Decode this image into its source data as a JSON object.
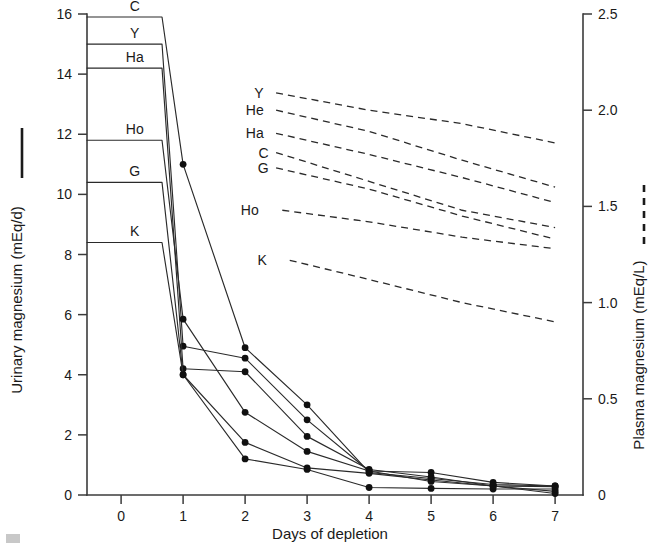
{
  "chart_data": {
    "type": "line",
    "title": "",
    "xlabel": "Days of depletion",
    "ylabel_left": "Urinary magnesium (mEq/d)",
    "ylabel_right": "Plasma magnesium (mEq/L)",
    "xlim": [
      -0.55,
      7.45
    ],
    "x_ticks": [
      0,
      1,
      2,
      3,
      4,
      5,
      6,
      7
    ],
    "x_tick_labels": [
      "0",
      "1",
      "2",
      "3",
      "4",
      "5",
      "6",
      "7"
    ],
    "ylim_left": [
      0,
      16
    ],
    "y_ticks_left": [
      0,
      2,
      4,
      6,
      8,
      10,
      12,
      14,
      16
    ],
    "y_tick_labels_left": [
      "0",
      "2",
      "4",
      "6",
      "8",
      "10",
      "12",
      "14",
      "16"
    ],
    "ylim_right": [
      0,
      2.5
    ],
    "y_ticks_right": [
      0,
      0.5,
      1.0,
      1.5,
      2.0,
      2.5
    ],
    "y_tick_labels_right": [
      "0",
      "0.5",
      "1.0",
      "1.5",
      "2.0",
      "2.5"
    ],
    "grid": false,
    "legend_position": "inline-labels",
    "urinary_series": [
      {
        "name": "C",
        "label": "C",
        "label_x": 0.22,
        "baseline_end_x": 0.66,
        "x": [
          0,
          1,
          2,
          3,
          4,
          5,
          6,
          7
        ],
        "y": [
          15.9,
          11.0,
          4.9,
          3.0,
          0.75,
          0.55,
          0.35,
          0.3
        ]
      },
      {
        "name": "Y",
        "label": "Y",
        "label_x": 0.22,
        "baseline_end_x": 0.66,
        "x": [
          0,
          1,
          2,
          3,
          4,
          5,
          6,
          7
        ],
        "y": [
          15.0,
          4.95,
          4.55,
          2.5,
          0.8,
          0.45,
          0.3,
          0.28
        ]
      },
      {
        "name": "Ha",
        "label": "Ha",
        "label_x": 0.22,
        "baseline_end_x": 0.66,
        "x": [
          0,
          1,
          2,
          3,
          4,
          5,
          6,
          7
        ],
        "y": [
          14.2,
          4.2,
          4.1,
          1.95,
          0.85,
          0.6,
          0.3,
          0.12
        ]
      },
      {
        "name": "Ho",
        "label": "Ho",
        "label_x": 0.22,
        "baseline_end_x": 0.66,
        "x": [
          0,
          1,
          2,
          3,
          4,
          5,
          6,
          7
        ],
        "y": [
          11.8,
          5.85,
          2.75,
          1.45,
          0.8,
          0.75,
          0.42,
          0.3
        ]
      },
      {
        "name": "G",
        "label": "G",
        "label_x": 0.22,
        "baseline_end_x": 0.66,
        "x": [
          0,
          1,
          2,
          3,
          4,
          5,
          6,
          7
        ],
        "y": [
          10.4,
          4.0,
          1.75,
          0.9,
          0.72,
          0.5,
          0.3,
          0.05
        ]
      },
      {
        "name": "K",
        "label": "K",
        "label_x": 0.22,
        "baseline_end_x": 0.66,
        "x": [
          0,
          1,
          2,
          3,
          4,
          5,
          6,
          7
        ],
        "y": [
          8.4,
          4.0,
          1.2,
          0.85,
          0.25,
          0.22,
          0.2,
          0.2
        ]
      }
    ],
    "plasma_series": [
      {
        "name": "Y",
        "label": "Y",
        "label_x": 2.3,
        "x": [
          2.5,
          4.0,
          5.5,
          7.0
        ],
        "y": [
          2.09,
          2.0,
          1.93,
          1.83
        ]
      },
      {
        "name": "He",
        "label": "He",
        "label_x": 2.3,
        "x": [
          2.5,
          4.0,
          5.5,
          7.0
        ],
        "y": [
          2.0,
          1.89,
          1.74,
          1.6
        ]
      },
      {
        "name": "Ha",
        "label": "Ha",
        "label_x": 2.3,
        "x": [
          2.5,
          4.0,
          5.5,
          7.0
        ],
        "y": [
          1.88,
          1.77,
          1.65,
          1.52
        ]
      },
      {
        "name": "C",
        "label": "C",
        "label_x": 2.38,
        "x": [
          2.5,
          4.0,
          5.5,
          7.0
        ],
        "y": [
          1.78,
          1.63,
          1.48,
          1.39
        ]
      },
      {
        "name": "G",
        "label": "G",
        "label_x": 2.38,
        "x": [
          2.5,
          4.0,
          5.5,
          7.0
        ],
        "y": [
          1.7,
          1.59,
          1.45,
          1.33
        ]
      },
      {
        "name": "Ho",
        "label": "Ho",
        "label_x": 2.22,
        "x": [
          2.6,
          4.0,
          5.5,
          7.0
        ],
        "y": [
          1.48,
          1.42,
          1.34,
          1.28
        ]
      },
      {
        "name": "K",
        "label": "K",
        "label_x": 2.35,
        "x": [
          2.72,
          4.0,
          5.5,
          7.0
        ],
        "y": [
          1.22,
          1.12,
          1.0,
          0.9
        ]
      }
    ]
  },
  "legend": {
    "solid_meaning": "Urinary magnesium (mEq/d)",
    "dashed_meaning": "Plasma magnesium (mEq/L)"
  }
}
